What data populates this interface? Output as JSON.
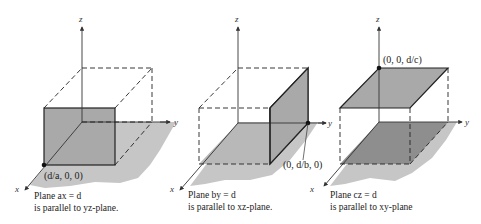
{
  "figure": {
    "panels": [
      {
        "id": "plane-ax",
        "axes": {
          "x": "x",
          "y": "y",
          "z": "z"
        },
        "point_label": "(d/a, 0, 0)",
        "caption_line1": "Plane ax = d",
        "caption_line2": "is parallel to yz-plane."
      },
      {
        "id": "plane-by",
        "axes": {
          "x": "x",
          "y": "y",
          "z": "z"
        },
        "point_label": "(0, d/b, 0)",
        "caption_line1": "Plane by = d",
        "caption_line2": "is parallel to xz-plane."
      },
      {
        "id": "plane-cz",
        "axes": {
          "x": "x",
          "y": "y",
          "z": "z"
        },
        "point_label": "(0, 0, d/c)",
        "caption_line1": "Plane cz = d",
        "caption_line2": "is parallel to xy-plane"
      }
    ],
    "colors": {
      "plane_fill": "#a9a9a9",
      "floor_shadow": "#c4c4c4",
      "dark_floor": "#8e8e8e",
      "line": "#222222"
    }
  }
}
